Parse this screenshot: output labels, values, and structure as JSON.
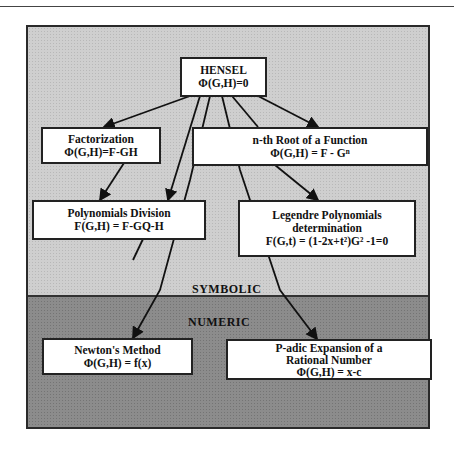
{
  "diagram": {
    "regions": {
      "symbolic": {
        "label": "SYMBOLIC",
        "color": "#cfcfcf"
      },
      "numeric": {
        "label": "NUMERIC",
        "color": "#8c8c8c"
      }
    },
    "nodes": {
      "hensel": {
        "title": "HENSEL",
        "formula": "Φ(G,H)=0"
      },
      "factorization": {
        "title": "Factorization",
        "formula": "Φ(G,H)=F-GH"
      },
      "nth_root": {
        "title": "n-th Root of a Function",
        "formula": "Φ(G,H) = F - Gⁿ"
      },
      "poly_division": {
        "title": "Polynomials Division",
        "formula": "F(G,H) = F-GQ-H"
      },
      "legendre": {
        "title": "Legendre Polynomials",
        "subtitle": "determination",
        "formula": "F(G,t) = (1-2x+t²)G² -1=0"
      },
      "newton": {
        "title": "Newton's Method",
        "formula": "Φ(G,H) = f(x)"
      },
      "padic": {
        "title": "P-adic Expansion of a",
        "subtitle": "Rational Number",
        "formula": "Φ(G,H) = x-c"
      }
    },
    "edges": [
      {
        "from": "HENSEL",
        "to": "Factorization"
      },
      {
        "from": "HENSEL",
        "to": "n-th Root of a Function"
      },
      {
        "from": "HENSEL",
        "to": "Polynomials Division"
      },
      {
        "from": "HENSEL",
        "to": "Legendre Polynomials determination"
      },
      {
        "from": "HENSEL",
        "to": "Newton's Method"
      },
      {
        "from": "HENSEL",
        "to": "P-adic Expansion of a Rational Number"
      },
      {
        "from": "Factorization",
        "to": "Polynomials Division"
      },
      {
        "from": "n-th Root of a Function",
        "to": "Legendre Polynomials determination"
      }
    ]
  }
}
